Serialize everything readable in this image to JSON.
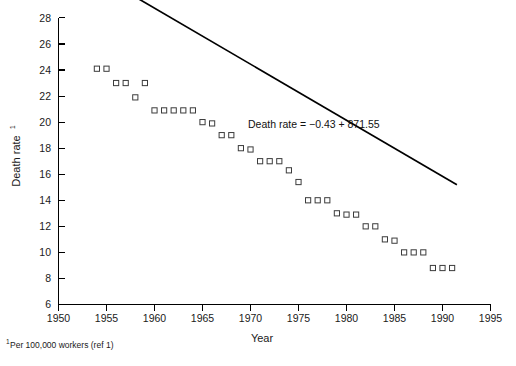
{
  "figure": {
    "background_color": "#ffffff",
    "ink_color": "#000000",
    "marker_edge_color": "#3c3c3c"
  },
  "labels": {
    "y_axis_title": "Death rate",
    "y_axis_title_superscript": "1",
    "x_axis_title": "Year",
    "equation": "Death rate = −0.43 + 871.55",
    "footnote_superscript": "1",
    "footnote": "Per 100,000 workers (ref 1)"
  },
  "chart_data": {
    "type": "scatter",
    "title": "",
    "xlabel": "Year",
    "ylabel": "Death rate",
    "xlim": [
      1950,
      1995
    ],
    "ylim": [
      6,
      28
    ],
    "xticks": [
      1950,
      1955,
      1960,
      1965,
      1970,
      1975,
      1980,
      1985,
      1990,
      1995
    ],
    "yticks": [
      6,
      8,
      10,
      12,
      14,
      16,
      18,
      20,
      22,
      24,
      26,
      28
    ],
    "grid": false,
    "legend": null,
    "annotations": [
      {
        "text": "Death rate = −0.43 + 871.55",
        "x": 1977.5,
        "y": 19.3
      }
    ],
    "series": [
      {
        "name": "Death rate (per 100,000 workers)",
        "marker": "open-square",
        "x": [
          1954,
          1955,
          1956,
          1957,
          1958,
          1959,
          1960,
          1961,
          1962,
          1963,
          1964,
          1965,
          1966,
          1967,
          1968,
          1969,
          1970,
          1971,
          1972,
          1973,
          1974,
          1975,
          1976,
          1977,
          1978,
          1979,
          1980,
          1981,
          1982,
          1983,
          1984,
          1985,
          1986,
          1987,
          1988,
          1989,
          1990,
          1991
        ],
        "y": [
          24.1,
          24.1,
          23.0,
          23.0,
          21.9,
          23.0,
          20.9,
          20.9,
          20.9,
          20.9,
          20.9,
          20.0,
          19.9,
          19.0,
          19.0,
          18.0,
          17.9,
          17.0,
          17.0,
          17.0,
          16.3,
          15.4,
          14.0,
          14.0,
          14.0,
          13.0,
          12.9,
          12.9,
          12.0,
          12.0,
          11.0,
          10.9,
          10.0,
          10.0,
          10.0,
          8.8,
          8.8,
          8.8
        ]
      }
    ],
    "fit_line": {
      "name": "least-squares regression line",
      "equation": "Death rate = −0.43 + 871.55",
      "slope": -0.43,
      "intercept": 871.55,
      "x_start": 1954,
      "x_end": 1991.5,
      "y_start": 31.33,
      "y_end": 15.2
    }
  }
}
